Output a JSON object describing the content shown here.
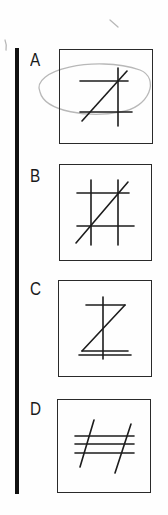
{
  "question": {
    "options": [
      {
        "label": "A",
        "figure": "two-horizontal-lines-one-vertical-one-diagonal",
        "circled": true
      },
      {
        "label": "B",
        "figure": "tic-tac-toe-grid-with-diagonal"
      },
      {
        "label": "C",
        "figure": "z-shape-with-vertical-and-double-base"
      },
      {
        "label": "D",
        "figure": "three-horizontal-lines-two-slanted"
      }
    ]
  },
  "colors": {
    "ink": "#1c1c1c",
    "bar": "#111111",
    "pencil": "#b8b8b8",
    "paper": "#fefefe"
  }
}
